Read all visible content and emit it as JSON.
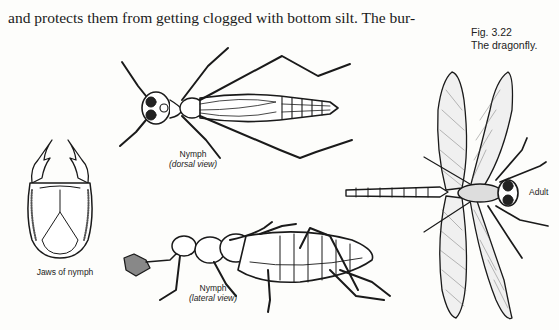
{
  "body_text": {
    "lines": [
      "and protects them from getting clogged with bottom silt. The bur-"
    ],
    "top_line_cut": "(partially cut off line above)"
  },
  "figure": {
    "number": "Fig. 3.22",
    "title": "The dragonfly.",
    "labels": {
      "jaws": "Jaws of nymph",
      "nymph_dorsal": "Nymph",
      "nymph_dorsal_view": "(dorsal view)",
      "nymph_lateral": "Nymph",
      "nymph_lateral_view": "(lateral view)",
      "adult": "Adult"
    }
  }
}
